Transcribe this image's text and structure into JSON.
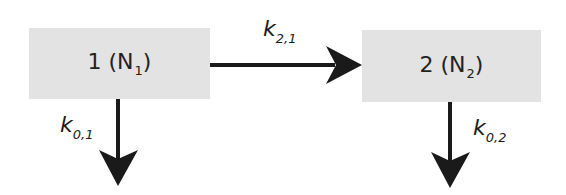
{
  "diagram": {
    "type": "two-compartment flow diagram",
    "nodes": [
      {
        "id": "1",
        "label": "1 (N",
        "sub": "1",
        "close": ")"
      },
      {
        "id": "2",
        "label": "2 (N",
        "sub": "2",
        "close": ")"
      }
    ],
    "edges": [
      {
        "from": "1",
        "to": "2",
        "label": "k",
        "sub": "2,1"
      },
      {
        "from": "1",
        "to": "out",
        "label": "k",
        "sub": "0,1"
      },
      {
        "from": "2",
        "to": "out",
        "label": "k",
        "sub": "0,2"
      }
    ],
    "colors": {
      "box_fill": "#e3e3e3",
      "arrow": "#1a1a1a",
      "background": "#ffffff"
    }
  }
}
